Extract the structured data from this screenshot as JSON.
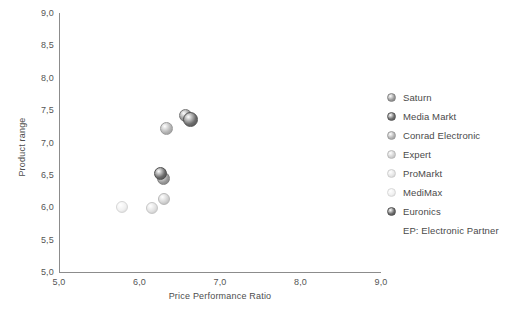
{
  "chart_data": {
    "type": "scatter",
    "title": "",
    "xlabel": "Price Performance Ratio",
    "ylabel": "Product range",
    "xlim": [
      5.0,
      9.0
    ],
    "ylim": [
      5.0,
      9.0
    ],
    "grid": false,
    "legend_position": "right",
    "decimal_separator": ",",
    "xticks": [
      "5,0",
      "6,0",
      "7,0",
      "8,0",
      "9,0"
    ],
    "xtick_values": [
      5.0,
      6.0,
      7.0,
      8.0,
      9.0
    ],
    "yticks": [
      "5,0",
      "5,5",
      "6,0",
      "6,5",
      "7,0",
      "7,5",
      "8,0",
      "8,5",
      "9,0"
    ],
    "ytick_values": [
      5.0,
      5.5,
      6.0,
      6.5,
      7.0,
      7.5,
      8.0,
      8.5,
      9.0
    ],
    "points": [
      {
        "name": "Saturn",
        "x": 6.3,
        "y": 6.45,
        "size": 13,
        "color": "#9a9a9a"
      },
      {
        "name": "Media Markt",
        "x": 6.63,
        "y": 7.36,
        "size": 15,
        "color": "#6e6e6e"
      },
      {
        "name": "Conrad Electronic",
        "x": 6.33,
        "y": 7.21,
        "size": 13,
        "color": "#b4b4b4"
      },
      {
        "name": "Expert",
        "x": 6.31,
        "y": 6.13,
        "size": 12,
        "color": "#d2d2d2"
      },
      {
        "name": "ProMarkt",
        "x": 6.15,
        "y": 5.99,
        "size": 12,
        "color": "#e0e0e0"
      },
      {
        "name": "MediMax",
        "x": 5.78,
        "y": 6.0,
        "size": 12,
        "color": "#f0f0f0"
      },
      {
        "name": "Euronics",
        "x": 6.26,
        "y": 6.52,
        "size": 13,
        "color": "#6a6a6a"
      },
      {
        "name": "Electronic Partner",
        "x": 6.57,
        "y": 7.42,
        "size": 13,
        "color": "#8f8f8f"
      }
    ],
    "annotations": [
      "EP: Electronic Partner"
    ]
  },
  "legend": {
    "items": [
      {
        "label": "Saturn",
        "color": "#9a9a9a"
      },
      {
        "label": "Media Markt",
        "color": "#6e6e6e"
      },
      {
        "label": "Conrad Electronic",
        "color": "#b4b4b4"
      },
      {
        "label": "Expert",
        "color": "#d2d2d2"
      },
      {
        "label": "ProMarkt",
        "color": "#e6e6e6"
      },
      {
        "label": "MediMax",
        "color": "#f0f0f0"
      },
      {
        "label": "Euronics",
        "color": "#6a6a6a"
      }
    ],
    "note": "EP: Electronic Partner"
  },
  "axes": {
    "x_title": "Price Performance Ratio",
    "y_title": "Product range"
  },
  "colors": {
    "axis": "#8c8c8c",
    "text": "#4a4a4a",
    "background": "#ffffff"
  }
}
